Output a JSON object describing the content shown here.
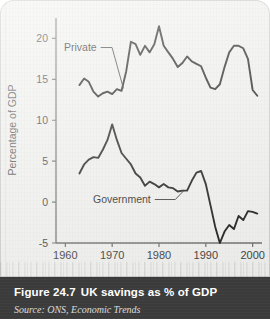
{
  "figure": {
    "number_label": "Figure 24.7",
    "title": "UK savings as % of GDP",
    "source": "Source: ONS, Economic Trends"
  },
  "chart_data": {
    "type": "line",
    "title": "UK savings as % of GDP",
    "xlabel": "",
    "ylabel": "Percentage of GDP",
    "xlim": [
      1958,
      2002
    ],
    "ylim": [
      -5,
      22.5
    ],
    "xticks": [
      1960,
      1970,
      1980,
      1990,
      2000
    ],
    "xtick_labels": [
      "1960",
      "1970",
      "1980",
      "1990",
      "2000"
    ],
    "yticks": [
      20,
      15,
      10,
      5,
      0,
      -5
    ],
    "ytick_labels": [
      "20",
      "15",
      "10",
      "5",
      "0",
      "-5"
    ],
    "grid": false,
    "legend": "inline-annotations",
    "line_color": "#1a1a1a",
    "annotations": [
      {
        "text": "Private",
        "x": 1963.5,
        "y": 17.6
      },
      {
        "text": "Government",
        "x": 1975.5,
        "y": -1.4
      }
    ],
    "series": [
      {
        "name": "Private",
        "x": [
          1963,
          1964,
          1965,
          1966,
          1967,
          1968,
          1969,
          1970,
          1971,
          1972,
          1973,
          1974,
          1975,
          1976,
          1977,
          1978,
          1979,
          1980,
          1981,
          1982,
          1983,
          1984,
          1985,
          1986,
          1987,
          1988,
          1989,
          1990,
          1991,
          1992,
          1993,
          1994,
          1995,
          1996,
          1997,
          1998,
          1999,
          2000,
          2001
        ],
        "values": [
          14.3,
          15.1,
          14.7,
          13.5,
          12.9,
          13.3,
          13.5,
          13.2,
          13.8,
          13.6,
          16.0,
          19.6,
          19.3,
          18.0,
          19.1,
          18.3,
          19.3,
          21.5,
          19.1,
          18.3,
          17.5,
          16.5,
          17.0,
          17.8,
          17.2,
          16.9,
          16.6,
          15.2,
          14.0,
          13.8,
          14.4,
          16.5,
          18.3,
          19.1,
          19.1,
          18.8,
          17.5,
          13.7,
          13.0
        ]
      },
      {
        "name": "Government",
        "x": [
          1963,
          1964,
          1965,
          1966,
          1967,
          1968,
          1969,
          1970,
          1971,
          1972,
          1973,
          1974,
          1975,
          1976,
          1977,
          1978,
          1979,
          1980,
          1981,
          1982,
          1983,
          1984,
          1985,
          1986,
          1987,
          1988,
          1989,
          1990,
          1991,
          1992,
          1993,
          1994,
          1995,
          1996,
          1997,
          1998,
          1999,
          2000,
          2001
        ],
        "values": [
          3.5,
          4.6,
          5.2,
          5.5,
          5.4,
          6.4,
          7.6,
          9.5,
          7.6,
          6.0,
          5.3,
          4.6,
          3.5,
          3.0,
          2.0,
          2.5,
          2.2,
          1.8,
          2.2,
          1.8,
          1.7,
          1.3,
          1.4,
          1.4,
          2.6,
          3.6,
          3.8,
          2.2,
          -0.4,
          -3.0,
          -5.0,
          -3.6,
          -2.8,
          -3.3,
          -1.7,
          -2.2,
          -1.1,
          -1.2,
          -1.4
        ]
      }
    ]
  }
}
